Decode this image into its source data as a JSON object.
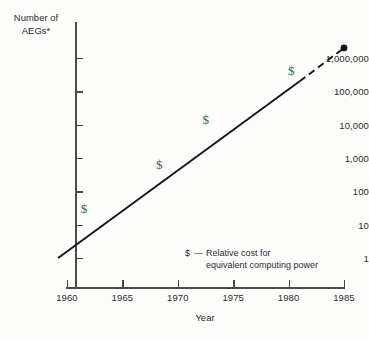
{
  "chart_data": {
    "type": "line",
    "title": "",
    "subtitle": "",
    "xlabel": "Year",
    "ylabel": "Number of\nAEGs*",
    "yscale": "log",
    "ylim": [
      1,
      1000000
    ],
    "xlim": [
      1958.5,
      1986
    ],
    "grid": false,
    "legend_position": "inside-lower-right",
    "x_ticks": [
      "1960",
      "1965",
      "1970",
      "1975",
      "1980",
      "1985"
    ],
    "x_tick_values": [
      1960,
      1965,
      1970,
      1975,
      1980,
      1985
    ],
    "y_ticks": [
      "1,000,000",
      "100,000",
      "10,000",
      "1,000",
      "100",
      "10",
      "1"
    ],
    "y_tick_values": [
      1000000,
      100000,
      10000,
      1000,
      100,
      10,
      1
    ],
    "series": [
      {
        "name": "Number of AEGs (solid trend)",
        "style": "solid",
        "color": "#141414",
        "x": [
          1959.2,
          1981.0
        ],
        "values": [
          1,
          200000
        ]
      },
      {
        "name": "Number of AEGs (projected)",
        "style": "dashed",
        "color": "#141414",
        "x": [
          1981.0,
          1985.0
        ],
        "values": [
          200000,
          2000000
        ]
      }
    ],
    "endpoint": {
      "x": 1985,
      "value": 2000000,
      "marker": "filled-circle"
    },
    "annotations": [
      {
        "text": "$",
        "x": 1961.6,
        "value": 30,
        "color": "#2f6b45"
      },
      {
        "text": "$",
        "x": 1968.4,
        "value": 600,
        "color": "#2f6b45"
      },
      {
        "text": "$",
        "x": 1972.6,
        "value": 14000,
        "color": "#2f6b45"
      },
      {
        "text": "$",
        "x": 1980.3,
        "value": 420000,
        "color": "#2f6b45"
      }
    ],
    "legend": {
      "symbol": "$",
      "dash": "—",
      "line1": "Relative cost for",
      "line2": "equivalent computing power"
    },
    "footnote_marker": "*"
  },
  "colors": {
    "line": "#141414",
    "axis": "#4a4a48",
    "text": "#2b2b2b",
    "dollar": "#2f6b45",
    "background": "#fdfdfb"
  }
}
